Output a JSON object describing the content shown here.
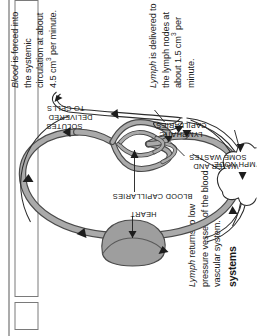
{
  "page": {
    "section_heading": "systems",
    "text_blocks": [
      {
        "id": "lymph-returns",
        "lead_italic": "Lymph",
        "text": " returns to low pressure vessels of the blood vascular system."
      },
      {
        "id": "blood-forced",
        "lead_italic": "Blood",
        "text_before_sup": " is forced into the systemic circulation at about 4.5 cm",
        "sup": "3",
        "text_after_sup": " per minute."
      },
      {
        "id": "lymph-delivered",
        "lead_italic": "Lymph",
        "text_before_sup": " is delivered to the lymph nodes at about 1.5 cm",
        "sup": "3",
        "text_after_sup": " per minute."
      }
    ]
  },
  "diagram": {
    "labels": {
      "heart": "HEART",
      "blood_capillaries": "BLOOD CAPILLARIES",
      "solutes_l1": "SOLUTES",
      "solutes_l2": "DELIVERED",
      "solutes_l3": "TO CELLS",
      "water_l1": "WATER AND",
      "water_l2": "SOME WASTES",
      "lymphatic_l1": "LYMPHATIC",
      "lymphatic_l2": "CAPILLARIES",
      "lymph_node": "LYMPH NODE"
    },
    "colors": {
      "vessel_fill": "#a8a8a8",
      "vessel_stroke": "#4a4a4a",
      "heart_fill": "#9e9e9e",
      "lymph_stroke": "#333333",
      "label_text": "#111111",
      "page_background": "#ffffff"
    }
  }
}
